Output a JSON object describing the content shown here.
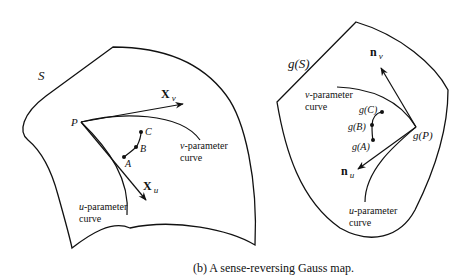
{
  "caption": "(b) A sense-reversing Gauss map.",
  "left_panel": {
    "surface_label": "S",
    "point_P": "P",
    "vector_v": {
      "symbol": "X",
      "subscript": "v"
    },
    "vector_u": {
      "symbol": "X",
      "subscript": "u"
    },
    "v_curve_label": {
      "var": "v",
      "line1": "-parameter",
      "line2": "curve"
    },
    "u_curve_label": {
      "var": "u",
      "line1": "-parameter",
      "line2": "curve"
    },
    "points": [
      "A",
      "B",
      "C"
    ]
  },
  "right_panel": {
    "surface_label": "g(S)",
    "point_gP": "g(P)",
    "normal_v": {
      "symbol": "n",
      "subscript": "v"
    },
    "normal_u": {
      "symbol": "n",
      "subscript": "u"
    },
    "v_curve_label": {
      "var": "v",
      "line1": "-parameter",
      "line2": "curve"
    },
    "u_curve_label": {
      "var": "u",
      "line1": "-parameter",
      "line2": "curve"
    },
    "points": [
      "g(A)",
      "g(B)",
      "g(C)"
    ]
  }
}
